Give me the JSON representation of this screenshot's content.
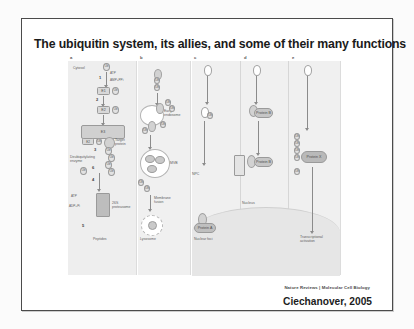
{
  "slide": {
    "title": "The ubiquitin system, its allies, and some of their many functions",
    "nature_credit": "Nature Reviews | Molecular Cell Biology",
    "citation": "Ciechanover, 2005"
  },
  "figure": {
    "panels": [
      {
        "letter": "a",
        "caption": "Peptides"
      },
      {
        "letter": "b",
        "caption": "Lysosome"
      },
      {
        "letter": "c",
        "caption": "Nuclear foci"
      },
      {
        "letter": "d",
        "caption": ""
      },
      {
        "letter": "e",
        "caption": "Transcriptional\nactivation"
      }
    ],
    "panel_a": {
      "compartment": "Cytosol",
      "ubiquitin": "Ub",
      "atp": "ATP",
      "amp_ppi": "AMP+PPi",
      "e1": "E1",
      "e2": "E2",
      "e3": "E3",
      "target_protein": "Target\nprotein",
      "dub": "Deubiquitylating\nenzyme",
      "proteasome": "26S\nproteasome",
      "atp2": "ATP",
      "adp_pi": "ADP+Pi",
      "peptides": "Peptides",
      "steps": [
        "1",
        "2",
        "3",
        "4",
        "5",
        "6"
      ]
    },
    "panel_b": {
      "early_endosome": "Early\nendosome",
      "mvb": "MVB",
      "membrane_fusion": "Membrane\nfusion",
      "lysosome": "Lysosome"
    },
    "panel_c": {
      "npc": "NPC",
      "protein_a": "Protein A",
      "nuclear_foci": "Nuclear foci"
    },
    "panel_d": {
      "nucleus": "Nucleus",
      "protein_b": "Protein B"
    },
    "panel_e": {
      "protein_x": "Protein X",
      "transcriptional_activation": "Transcriptional\nactivation"
    }
  }
}
